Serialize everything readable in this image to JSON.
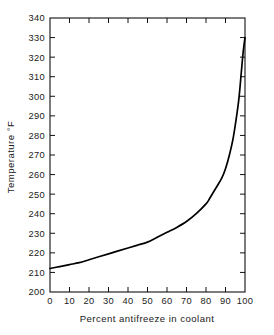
{
  "chart_data": {
    "type": "line",
    "title": "",
    "subtitle": "",
    "xlabel": "Percent antifreeze in coolant",
    "ylabel": "Temperature °F",
    "xlim": [
      0,
      100
    ],
    "ylim": [
      200,
      340
    ],
    "grid": false,
    "legend": null,
    "xticks": [
      0,
      10,
      20,
      30,
      40,
      50,
      60,
      70,
      80,
      90,
      100
    ],
    "xtick_labels": [
      "0",
      "10",
      "20",
      "30",
      "40",
      "50",
      "60",
      "70",
      "80",
      "90",
      "100"
    ],
    "yticks": [
      200,
      210,
      220,
      230,
      240,
      250,
      260,
      270,
      280,
      290,
      300,
      310,
      320,
      330,
      340
    ],
    "ytick_labels": [
      "200",
      "210",
      "220",
      "230",
      "240",
      "250",
      "260",
      "270",
      "280",
      "290",
      "300",
      "310",
      "320",
      "330",
      "340"
    ],
    "series": [
      {
        "name": "Boiling point of coolant",
        "color": "#000000",
        "x": [
          0,
          5,
          10,
          15,
          20,
          25,
          30,
          35,
          40,
          45,
          50,
          55,
          60,
          65,
          70,
          75,
          80,
          82,
          85,
          88,
          90,
          92,
          94,
          96,
          97,
          98,
          99,
          100
        ],
        "values": [
          212,
          213,
          214,
          215,
          216.5,
          218,
          219.5,
          221,
          222.5,
          224,
          225.5,
          228,
          230.5,
          233,
          236,
          240,
          245,
          248,
          253,
          258,
          263,
          270,
          279,
          292,
          300,
          311,
          322,
          330
        ]
      }
    ],
    "annotations": []
  },
  "axes": {
    "x_axis_name": "Percent antifreeze in coolant",
    "y_axis_name": "Temperature °F",
    "tick_direction": "in",
    "frame": "box",
    "frame_color": "#111111"
  },
  "figure": {
    "background_color": "#ffffff",
    "foreground_color": "#111111"
  }
}
